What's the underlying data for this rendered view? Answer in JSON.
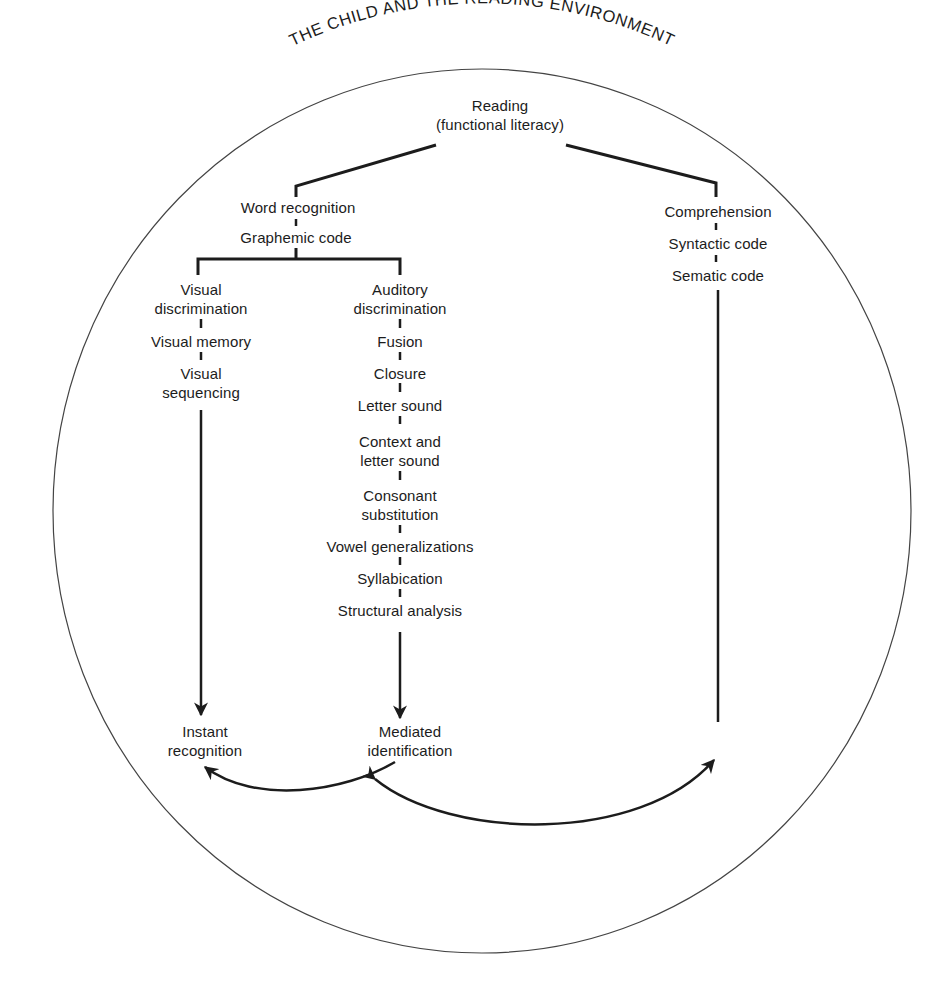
{
  "title": "THE CHILD AND THE READING ENVIRONMENT",
  "root": {
    "line1": "Reading",
    "line2": "(functional literacy)"
  },
  "left_branch": {
    "items": [
      "Word recognition",
      "Graphemic code"
    ],
    "visual": {
      "items": [
        {
          "line1": "Visual",
          "line2": "discrimination"
        },
        {
          "line1": "Visual memory",
          "line2": ""
        },
        {
          "line1": "Visual",
          "line2": "sequencing"
        }
      ],
      "outcome": {
        "line1": "Instant",
        "line2": "recognition"
      }
    },
    "auditory": {
      "items": [
        {
          "line1": "Auditory",
          "line2": "discrimination"
        },
        {
          "line1": "Fusion",
          "line2": ""
        },
        {
          "line1": "Closure",
          "line2": ""
        },
        {
          "line1": "Letter sound",
          "line2": ""
        },
        {
          "line1": "Context and",
          "line2": "letter sound"
        },
        {
          "line1": "Consonant",
          "line2": "substitution"
        },
        {
          "line1": "Vowel generalizations",
          "line2": ""
        },
        {
          "line1": "Syllabication",
          "line2": ""
        },
        {
          "line1": "Structural analysis",
          "line2": ""
        }
      ],
      "outcome": {
        "line1": "Mediated",
        "line2": "identification"
      }
    }
  },
  "right_branch": {
    "items": [
      "Comprehension",
      "Syntactic code",
      "Sematic code"
    ]
  },
  "colors": {
    "ink": "#1c1c1c",
    "background": "#ffffff"
  }
}
